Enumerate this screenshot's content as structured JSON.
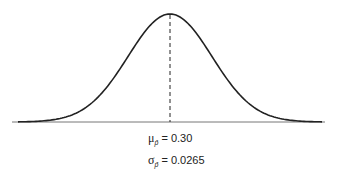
{
  "diagram": {
    "type": "normal-distribution-curve",
    "center_line": "dashed",
    "colors": {
      "curve": "#222222",
      "axis": "#777777",
      "background": "#ffffff"
    }
  },
  "labels": {
    "mean": {
      "symbol": "μ",
      "subscript": "p̂",
      "equals": "= 0.30"
    },
    "sd": {
      "symbol": "σ",
      "subscript": "p̂",
      "equals": "= 0.0265"
    }
  },
  "chart_data": {
    "type": "line",
    "title": "",
    "mean": 0.3,
    "std_dev": 0.0265,
    "xlabel": "",
    "ylabel": "",
    "grid": false,
    "annotations": [
      "μ_p̂ = 0.30",
      "σ_p̂ = 0.0265"
    ]
  }
}
